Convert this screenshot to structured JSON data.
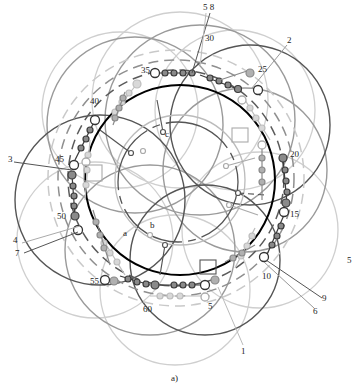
{
  "figure": {
    "caption": "a)",
    "top_cut_text": "",
    "slot_labels": [
      {
        "text": "30",
        "x": 205,
        "y": 34
      },
      {
        "text": "25",
        "x": 258,
        "y": 65
      },
      {
        "text": "20",
        "x": 290,
        "y": 144
      },
      {
        "text": "15",
        "x": 292,
        "y": 215
      },
      {
        "text": "10",
        "x": 262,
        "y": 272
      },
      {
        "text": "5",
        "x": 210,
        "y": 304
      },
      {
        "text": "60",
        "x": 143,
        "y": 304
      },
      {
        "text": "55",
        "x": 90,
        "y": 276
      },
      {
        "text": "50",
        "x": 57,
        "y": 211
      },
      {
        "text": "45",
        "x": 55,
        "y": 160
      },
      {
        "text": "40",
        "x": 90,
        "y": 101
      },
      {
        "text": "35",
        "x": 141,
        "y": 65
      }
    ],
    "lead_labels": [
      {
        "text": "5 8",
        "x": 203,
        "y": 10
      },
      {
        "text": "2",
        "x": 288,
        "y": 42
      },
      {
        "text": "3",
        "x": 8,
        "y": 158
      },
      {
        "text": "4",
        "x": 13,
        "y": 240
      },
      {
        "text": "7",
        "x": 15,
        "y": 253
      },
      {
        "text": "9",
        "x": 322,
        "y": 297
      },
      {
        "text": "6",
        "x": 313,
        "y": 310
      },
      {
        "text": "1",
        "x": 241,
        "y": 349
      },
      {
        "text": "5",
        "x": 347,
        "y": 260
      }
    ],
    "inner_labels": [
      {
        "text": "a",
        "x": 123,
        "y": 234
      },
      {
        "text": "b",
        "x": 150,
        "y": 225
      },
      {
        "text": "c",
        "x": 165,
        "y": 133
      }
    ],
    "colors": {
      "phase_dark": "#3a3a3a",
      "phase_mid": "#7a7a7a",
      "phase_light": "#bdbdbd",
      "rotor_circle": "#000000"
    }
  }
}
